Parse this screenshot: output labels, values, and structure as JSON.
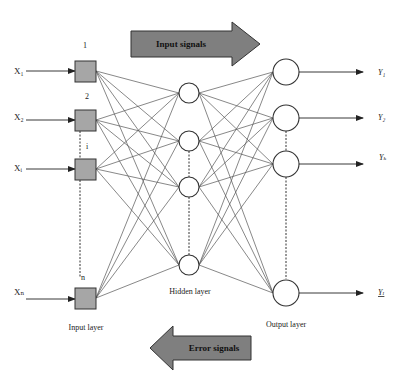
{
  "diagram": {
    "type": "feedforward-neural-network",
    "banners": {
      "forward": {
        "label": "Input signals",
        "direction": "right",
        "fill": "#7f7f7f"
      },
      "backward": {
        "label": "Error signals",
        "direction": "left",
        "fill": "#7f7f7f"
      }
    },
    "layers": {
      "input": {
        "title": "Input layer",
        "nodes": [
          {
            "index_label": "1",
            "input_label": "X₁"
          },
          {
            "index_label": "2",
            "input_label": "X₂"
          },
          {
            "index_label": "i",
            "input_label": "Xᵢ"
          },
          {
            "index_label": "n",
            "input_label": "Xₙ"
          }
        ],
        "node_fill": "#a6a6a6"
      },
      "hidden": {
        "title": "Hidden layer",
        "node_count_shown": 4
      },
      "output": {
        "title": "Output layer",
        "nodes": [
          {
            "output_label": "Y₁"
          },
          {
            "output_label": "Y₂"
          },
          {
            "output_label": "Yₖ"
          },
          {
            "output_label": "Yₗ"
          }
        ]
      }
    }
  }
}
